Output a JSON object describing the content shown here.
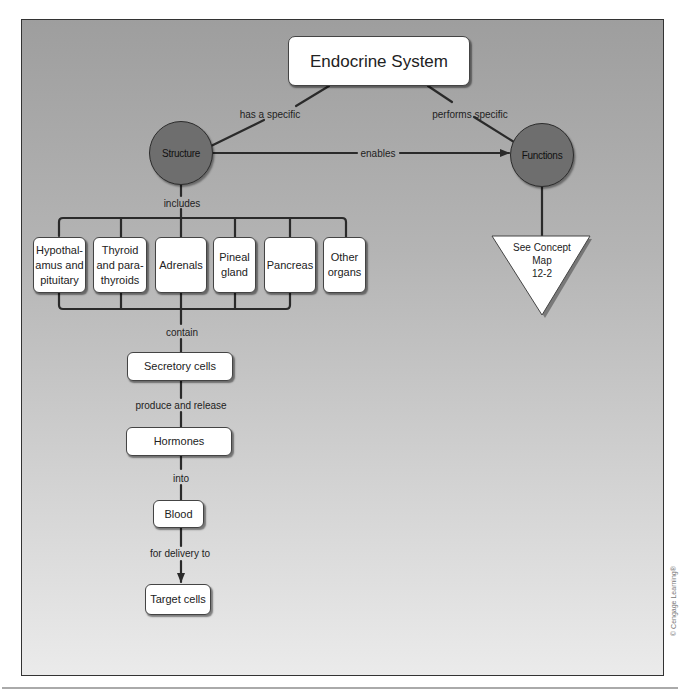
{
  "diagram": {
    "title": "Endocrine System",
    "concepts": {
      "structure": "Structure",
      "functions": "Functions"
    },
    "links": {
      "has_specific": "has a specific",
      "performs_specific": "performs specific",
      "enables": "enables",
      "includes": "includes",
      "contain": "contain",
      "produce_release": "produce and release",
      "into": "into",
      "for_delivery_to": "for delivery to"
    },
    "organs": [
      {
        "line1": "Hypothal-",
        "line2": "amus and",
        "line3": "pituitary"
      },
      {
        "line1": "Thyroid",
        "line2": "and para-",
        "line3": "thyroids"
      },
      {
        "line1": "Adrenals",
        "line2": "",
        "line3": ""
      },
      {
        "line1": "Pineal",
        "line2": "gland",
        "line3": ""
      },
      {
        "line1": "Pancreas",
        "line2": "",
        "line3": ""
      },
      {
        "line1": "Other",
        "line2": "organs",
        "line3": ""
      }
    ],
    "chain": {
      "secretory_cells": "Secretory cells",
      "hormones": "Hormones",
      "blood": "Blood",
      "target_cells": "Target cells"
    },
    "reference": {
      "line1": "See Concept",
      "line2": "Map",
      "line3": "12-2"
    },
    "copyright": "© Cengage Learning®",
    "colors": {
      "background_top": "#9e9e9e",
      "background_bottom": "#ebebeb",
      "concept_circle": "#6e6e6e",
      "line": "#2a2a2a",
      "node_fill": "#ffffff"
    }
  }
}
